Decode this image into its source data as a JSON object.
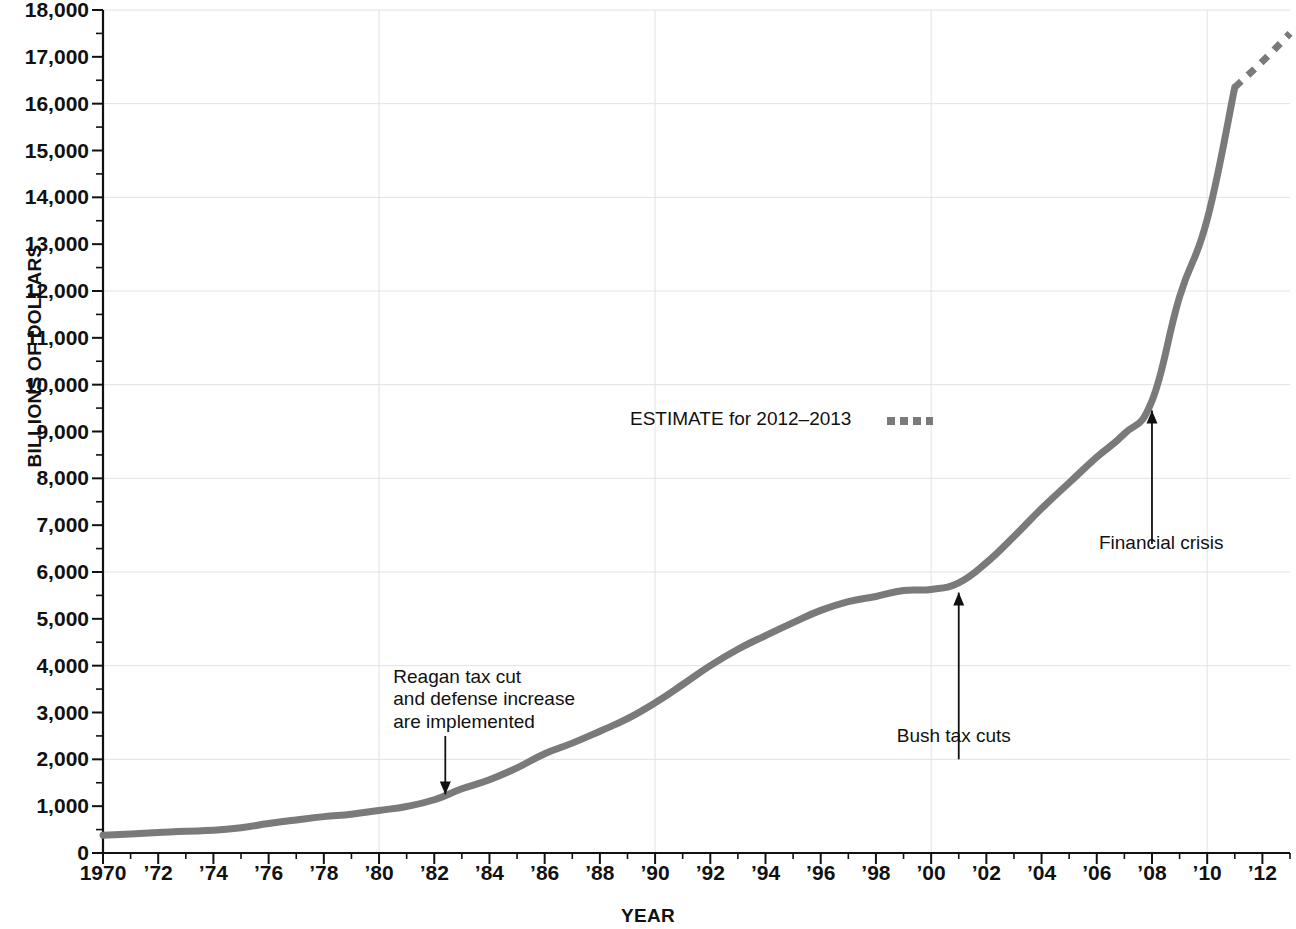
{
  "chart_data": {
    "type": "line",
    "title": "",
    "xlabel": "YEAR",
    "ylabel": "BILLIONS OF DOLLARS",
    "xlim": [
      1970,
      2013
    ],
    "ylim": [
      0,
      18000
    ],
    "grid": "faint horizontal every 2000, faint vertical at decades",
    "y_ticks": [
      0,
      1000,
      2000,
      3000,
      4000,
      5000,
      6000,
      7000,
      8000,
      9000,
      10000,
      11000,
      12000,
      13000,
      14000,
      15000,
      16000,
      17000,
      18000
    ],
    "y_tick_labels": [
      "0",
      "1,000",
      "2,000",
      "3,000",
      "4,000",
      "5,000",
      "6,000",
      "7,000",
      "8,000",
      "9,000",
      "10,000",
      "11,000",
      "12,000",
      "13,000",
      "14,000",
      "15,000",
      "16,000",
      "17,000",
      "18,000"
    ],
    "y_minor_tick_step": 500,
    "x_ticks": [
      1970,
      1972,
      1974,
      1976,
      1978,
      1980,
      1982,
      1984,
      1986,
      1988,
      1990,
      1992,
      1994,
      1996,
      1998,
      2000,
      2002,
      2004,
      2006,
      2008,
      2010,
      2012
    ],
    "x_tick_labels": [
      "1970",
      "’72",
      "’74",
      "’76",
      "’78",
      "’80",
      "’82",
      "’84",
      "’86",
      "’88",
      "’90",
      "’92",
      "’94",
      "’96",
      "’98",
      "’00",
      "’02",
      "’04",
      "’06",
      "’08",
      "’10",
      "’12"
    ],
    "x_minor_tick_step": 1,
    "line_color": "#7a7a7a",
    "series": [
      {
        "name": "Gross federal debt (actual)",
        "style": "solid",
        "x": [
          1970,
          1971,
          1972,
          1973,
          1974,
          1975,
          1976,
          1977,
          1978,
          1979,
          1980,
          1981,
          1982,
          1983,
          1984,
          1985,
          1986,
          1987,
          1988,
          1989,
          1990,
          1991,
          1992,
          1993,
          1994,
          1995,
          1996,
          1997,
          1998,
          1999,
          2000,
          2001,
          2002,
          2003,
          2004,
          2005,
          2006,
          2007,
          2008,
          2009,
          2010,
          2011
        ],
        "values": [
          381,
          408,
          436,
          466,
          484,
          541,
          629,
          706,
          777,
          829,
          909,
          994,
          1137,
          1371,
          1564,
          1817,
          2120,
          2346,
          2601,
          2868,
          3206,
          3598,
          4001,
          4351,
          4643,
          4920,
          5181,
          5369,
          5478,
          5605,
          5628,
          5769,
          6198,
          6760,
          7354,
          7905,
          8451,
          8951,
          9654,
          11876,
          13529,
          16351
        ]
      },
      {
        "name": "ESTIMATE for 2012–2013",
        "style": "dotted",
        "x": [
          2011,
          2012,
          2013
        ],
        "values": [
          16351,
          16900,
          17500
        ]
      }
    ],
    "annotations": [
      {
        "id": "reagan",
        "text": "Reagan tax cut\nand defense increase\nare implemented",
        "arrow": "down",
        "target_x": 1982.4,
        "target_y": 1130
      },
      {
        "id": "bush",
        "text": "Bush tax cuts",
        "arrow": "up",
        "target_x": 2001,
        "target_y": 5769
      },
      {
        "id": "financial-crisis",
        "text": "Financial crisis",
        "arrow": "up",
        "target_x": 2008,
        "target_y": 9654
      }
    ],
    "legend": {
      "position": "inside-center",
      "label": "ESTIMATE for 2012–2013",
      "swatch": "dotted-gray"
    }
  },
  "labels": {
    "y_axis_title": "BILLIONS OF DOLLARS",
    "x_axis_title": "YEAR",
    "legend_label": "ESTIMATE for 2012–2013",
    "annotation_reagan": "Reagan tax cut\nand defense increase\nare implemented",
    "annotation_bush": "Bush tax cuts",
    "annotation_crisis": "Financial crisis"
  }
}
